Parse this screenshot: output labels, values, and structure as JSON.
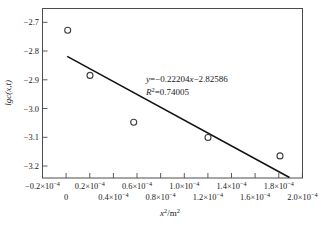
{
  "chart_data": {
    "type": "scatter",
    "title": "",
    "xlabel": "x²/m²",
    "ylabel": "lgc(x,t)",
    "xlim": [
      -2e-05,
      0.0002
    ],
    "ylim": [
      -3.25,
      -2.66
    ],
    "grid": false,
    "legend": null,
    "x_tick_values": [
      -2e-05,
      0.0,
      2e-05,
      4e-05,
      6e-05,
      8e-05,
      0.0001,
      0.00012,
      0.00014,
      0.00016,
      0.00018,
      0.0002
    ],
    "x_tick_labels": [
      {
        "mantissa": "−0.2×10",
        "exponent": "−4",
        "row": "top"
      },
      {
        "mantissa": "0",
        "exponent": "",
        "row": "bottom"
      },
      {
        "mantissa": "0.2×10",
        "exponent": "−4",
        "row": "top"
      },
      {
        "mantissa": "0.4×10",
        "exponent": "−4",
        "row": "bottom"
      },
      {
        "mantissa": "0.6×10",
        "exponent": "−4",
        "row": "top"
      },
      {
        "mantissa": "0.8×10",
        "exponent": "−4",
        "row": "bottom"
      },
      {
        "mantissa": "1.0×10",
        "exponent": "−4",
        "row": "top"
      },
      {
        "mantissa": "1.2×10",
        "exponent": "−4",
        "row": "bottom"
      },
      {
        "mantissa": "1.4×10",
        "exponent": "−4",
        "row": "top"
      },
      {
        "mantissa": "1.6×10",
        "exponent": "−4",
        "row": "bottom"
      },
      {
        "mantissa": "1.8×10",
        "exponent": "−4",
        "row": "top"
      },
      {
        "mantissa": "2.0×10",
        "exponent": "−4",
        "row": "bottom"
      }
    ],
    "y_tick_values": [
      -2.7,
      -2.8,
      -2.9,
      -3.0,
      -3.1,
      -3.2
    ],
    "y_tick_labels": [
      "−2.7",
      "−2.8",
      "−2.9",
      "−3.0",
      "−3.1",
      "−3.2"
    ],
    "series": [
      {
        "name": "data",
        "marker": "open-circle",
        "points": [
          {
            "x": 1e-06,
            "y": -2.731
          },
          {
            "x": 2e-05,
            "y": -2.888
          },
          {
            "x": 5.7e-05,
            "y": -3.051
          },
          {
            "x": 0.00012,
            "y": -3.104
          },
          {
            "x": 0.000181,
            "y": -3.168
          }
        ]
      },
      {
        "name": "linear-fit",
        "type": "line",
        "slope": -0.22204,
        "intercept": -2.82586,
        "r_squared": 0.74005,
        "x_start": 1.5e-06,
        "x_end": 0.000178,
        "y_start": -2.838,
        "y_end": -3.225
      }
    ],
    "annotations": [
      {
        "name": "regression-equation",
        "text": "y=−0.22204x−2.82586",
        "x_px": 146,
        "y_px": 81
      },
      {
        "name": "r-squared",
        "text_prefix": "R",
        "text_sup": "2",
        "text_suffix": "=0.74005",
        "x_px": 146,
        "y_px": 94
      }
    ],
    "colors": {
      "frame": "#4c4c4c",
      "marker": "#3d3d3d",
      "fit_line": "#111111",
      "text": "#1a1a1a",
      "background": "#ffffff"
    }
  }
}
